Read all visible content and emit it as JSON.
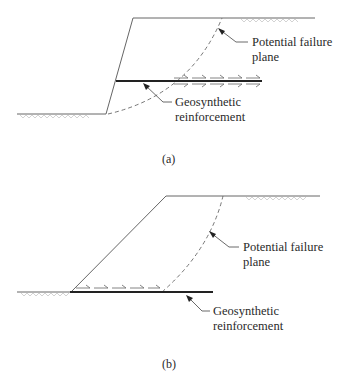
{
  "figure": {
    "panels": [
      {
        "id": "a",
        "caption": "(a)",
        "description": "Reinforced near-vertical wall with horizontal geosynthetic crossing the failure plane",
        "labels": {
          "failure_plane_line1": "Potential failure",
          "failure_plane_line2": "plane",
          "reinforcement_line1": "Geosynthetic",
          "reinforcement_line2": "reinforcement"
        }
      },
      {
        "id": "b",
        "caption": "(b)",
        "description": "Embankment slope on geosynthetic base reinforcement",
        "labels": {
          "failure_plane_line1": "Potential failure",
          "failure_plane_line2": "plane",
          "reinforcement_line1": "Geosynthetic",
          "reinforcement_line2": "reinforcement"
        }
      }
    ],
    "colors": {
      "line": "#555555",
      "reinforcement": "#222222",
      "hatch": "#aaaaaa",
      "text": "#2a2a2a"
    }
  }
}
